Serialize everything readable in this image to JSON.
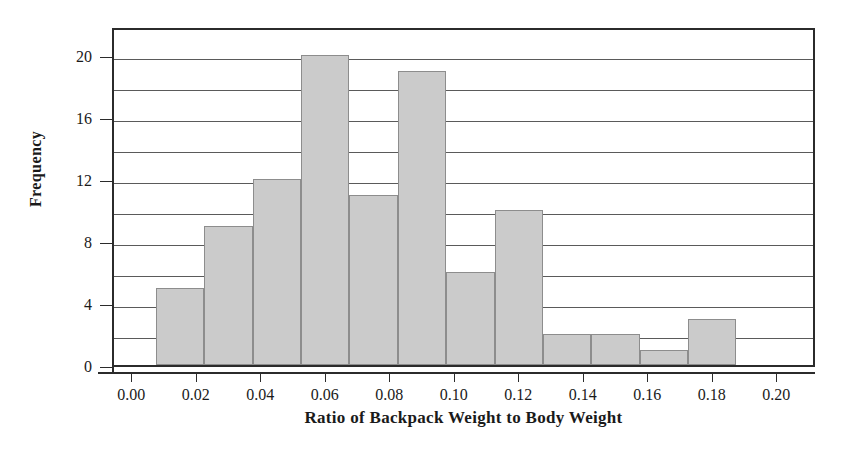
{
  "chart_data": {
    "type": "bar",
    "title": "",
    "subtitle": "",
    "xlabel": "Ratio of Backpack Weight to Body Weight",
    "ylabel": "Frequency",
    "xlim": [
      -0.006,
      0.212
    ],
    "ylim": [
      0,
      21.9
    ],
    "grid": true,
    "legend": null,
    "grid_interval": 2,
    "bin_width": 0.015,
    "bin_starts": [
      0.007,
      0.022,
      0.037,
      0.052,
      0.067,
      0.082,
      0.097,
      0.112,
      0.127,
      0.142,
      0.157,
      0.172
    ],
    "bin_ends": [
      0.022,
      0.037,
      0.052,
      0.067,
      0.082,
      0.097,
      0.112,
      0.127,
      0.142,
      0.157,
      0.172,
      0.187
    ],
    "values": [
      5,
      9,
      12,
      20,
      11,
      19,
      6,
      10,
      2,
      2,
      1,
      3
    ],
    "categories": [
      "0.007-0.022",
      "0.022-0.037",
      "0.037-0.052",
      "0.052-0.067",
      "0.067-0.082",
      "0.082-0.097",
      "0.097-0.112",
      "0.112-0.127",
      "0.127-0.142",
      "0.142-0.157",
      "0.157-0.172",
      "0.172-0.187"
    ],
    "total_count": 100,
    "xticks": [
      {
        "value": 0.0,
        "label": "0.00"
      },
      {
        "value": 0.02,
        "label": "0.02"
      },
      {
        "value": 0.04,
        "label": "0.04"
      },
      {
        "value": 0.06,
        "label": "0.06"
      },
      {
        "value": 0.08,
        "label": "0.08"
      },
      {
        "value": 0.1,
        "label": "0.10"
      },
      {
        "value": 0.12,
        "label": "0.12"
      },
      {
        "value": 0.14,
        "label": "0.14"
      },
      {
        "value": 0.16,
        "label": "0.16"
      },
      {
        "value": 0.18,
        "label": "0.18"
      },
      {
        "value": 0.2,
        "label": "0.20"
      }
    ],
    "yticks": [
      {
        "value": 0,
        "label": "0"
      },
      {
        "value": 4,
        "label": "4"
      },
      {
        "value": 8,
        "label": "8"
      },
      {
        "value": 12,
        "label": "12"
      },
      {
        "value": 16,
        "label": "16"
      },
      {
        "value": 20,
        "label": "20"
      }
    ],
    "gridline_values": [
      2,
      4,
      6,
      8,
      10,
      12,
      14,
      16,
      18,
      20
    ],
    "colors": {
      "bar_fill": "#cbcbcb",
      "bar_stroke": "#8d8d8d",
      "frame": "#2b2b2b",
      "gridline": "#5a5a5a",
      "text": "#1a1a1a",
      "background": "#ffffff"
    }
  }
}
